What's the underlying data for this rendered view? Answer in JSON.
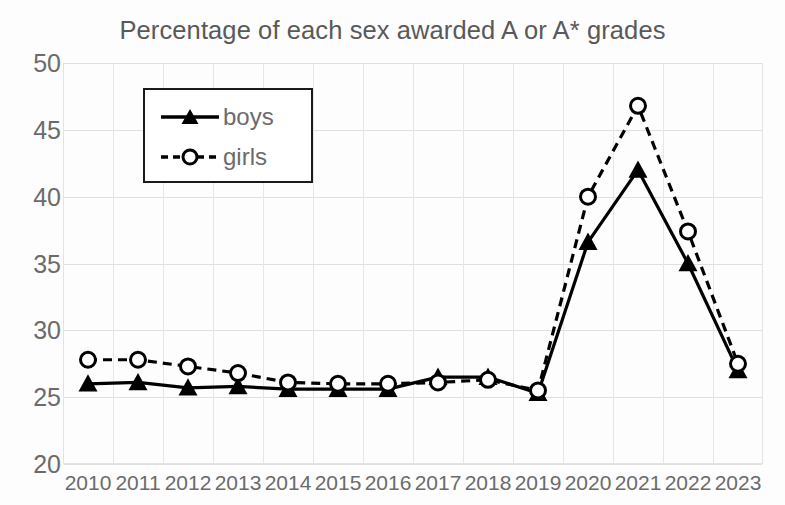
{
  "chart_data": {
    "type": "line",
    "title": "Percentage of each sex awarded A or A* grades",
    "xlabel": "",
    "ylabel": "",
    "categories": [
      "2010",
      "2011",
      "2012",
      "2013",
      "2014",
      "2015",
      "2016",
      "2017",
      "2018",
      "2019",
      "2020",
      "2021",
      "2022",
      "2023"
    ],
    "series": [
      {
        "name": "boys",
        "marker": "filled-triangle",
        "linestyle": "solid",
        "color": "#000000",
        "values": [
          26.0,
          26.1,
          25.7,
          25.8,
          25.6,
          25.6,
          25.6,
          26.5,
          26.5,
          25.3,
          36.6,
          42.0,
          35.0,
          27.0
        ]
      },
      {
        "name": "girls",
        "marker": "open-circle",
        "linestyle": "dashed",
        "color": "#000000",
        "values": [
          27.8,
          27.8,
          27.3,
          26.8,
          26.1,
          26.0,
          26.0,
          26.1,
          26.3,
          25.5,
          40.0,
          46.8,
          37.4,
          27.5
        ]
      }
    ],
    "ylim": [
      20,
      50
    ],
    "yticks": [
      20,
      25,
      30,
      35,
      40,
      45,
      50
    ],
    "ytick_labels": [
      "20",
      "25",
      "30",
      "35",
      "40",
      "45",
      "50"
    ],
    "xtick_labels": [
      "2010",
      "2011",
      "2012",
      "2013",
      "2014",
      "2015",
      "2016",
      "2017",
      "2018",
      "2019",
      "2020",
      "2021",
      "2022",
      "2023"
    ],
    "grid": true,
    "legend_position": "upper-left",
    "legend_entries": [
      "boys",
      "girls"
    ]
  },
  "legend": {
    "boys_label": "boys",
    "girls_label": "girls"
  },
  "colors": {
    "line": "#000000",
    "text": "#6b6b6b",
    "title": "#595959",
    "grid": "#e0e0e0",
    "background": "#ffffff"
  }
}
